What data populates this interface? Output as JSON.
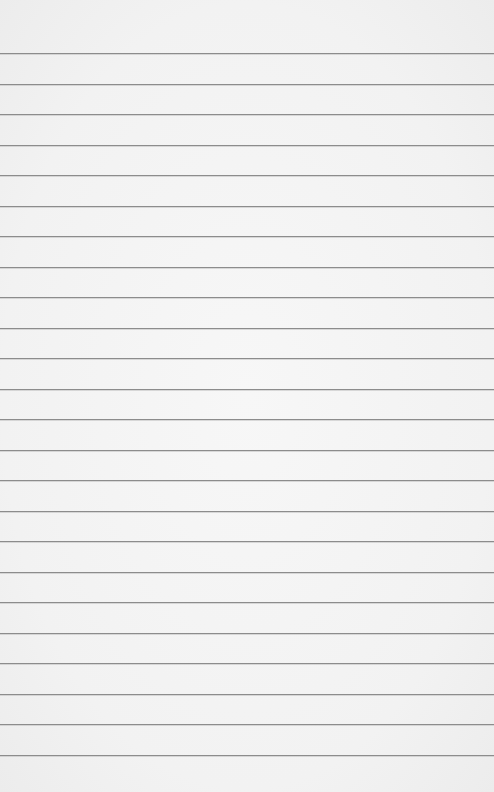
{
  "paper": {
    "type": "lined",
    "background_color": "#f3f3f3",
    "line_color": "#8c8c8c",
    "first_line_y": 53,
    "line_spacing": 30.5,
    "line_count": 24
  }
}
